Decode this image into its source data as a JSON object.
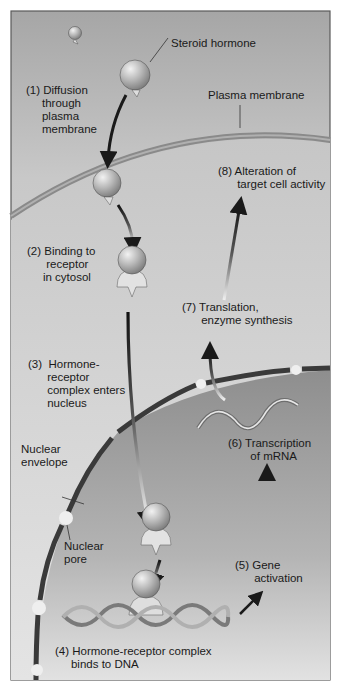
{
  "diagram": {
    "structures": {
      "steroid_hormone": "Steroid hormone",
      "plasma_membrane": "Plasma membrane",
      "nuclear_envelope": "Nuclear\nenvelope",
      "nuclear_pore": "Nuclear\npore"
    },
    "steps": [
      {
        "num": "(1)",
        "text": "(1) Diffusion\n     through\n     plasma\n     membrane"
      },
      {
        "num": "(2)",
        "text": "(2) Binding to\n      receptor\n     in cytosol"
      },
      {
        "num": "(3)",
        "text": "(3)  Hormone-\n      receptor\n      complex enters\n      nucleus"
      },
      {
        "num": "(4)",
        "text": "(4) Hormone-receptor complex\n     binds to DNA"
      },
      {
        "num": "(5)",
        "text": "(5) Gene\n      activation"
      },
      {
        "num": "(6)",
        "text": "(6) Transcription\n       of mRNA"
      },
      {
        "num": "(7)",
        "text": "(7) Translation,\n      enzyme synthesis"
      },
      {
        "num": "(8)",
        "text": "(8) Alteration of\n      target cell activity"
      }
    ],
    "colors": {
      "frame_border": "#5a5a5a",
      "extracellular_top": "#a8a8a8",
      "extracellular_bottom": "#d8d8d8",
      "plasma_membrane": "#8c8c8c",
      "cytosol": "#cfcfcf",
      "nuclear_envelope": "#3c3c3c",
      "nucleoplasm": "#9a9a9a",
      "hormone": "#bdbdbd",
      "receptor": "#e2e2e2",
      "arrow": "#1e1e1e"
    }
  }
}
